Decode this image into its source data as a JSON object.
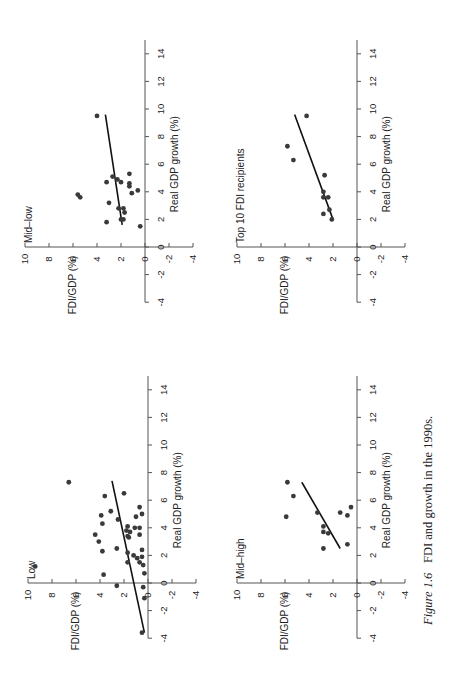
{
  "figure": {
    "caption_label": "Figure 1.6",
    "caption_text": "FDI and growth in the 1990s.",
    "orientation": "rotated 90° counter-clockwise"
  },
  "colors": {
    "axis": "#555555",
    "dot": "#3a3a3a",
    "line": "#111111",
    "text": "#222222"
  },
  "chart_data": [
    {
      "type": "scatter",
      "title": "Mid-low",
      "xlabel": "Real GDP growth (%)",
      "ylabel": "FDI/GDP (%)",
      "xlim": [
        -4,
        15
      ],
      "ylim": [
        -4,
        10
      ],
      "xticks": [
        -4,
        -2,
        0,
        2,
        4,
        6,
        8,
        10,
        12,
        14
      ],
      "yticks": [
        -4,
        -2,
        0,
        2,
        4,
        6,
        8,
        10
      ],
      "points": [
        [
          4.7,
          3.2
        ],
        [
          5.1,
          2.7
        ],
        [
          4.9,
          2.3
        ],
        [
          4.7,
          2.0
        ],
        [
          5.3,
          1.3
        ],
        [
          4.6,
          1.3
        ],
        [
          4.4,
          1.3
        ],
        [
          3.9,
          1.1
        ],
        [
          4.1,
          0.6
        ],
        [
          3.2,
          3.0
        ],
        [
          2.8,
          2.2
        ],
        [
          2.8,
          1.8
        ],
        [
          2.5,
          1.7
        ],
        [
          2.0,
          1.8
        ],
        [
          2.0,
          2.0
        ],
        [
          1.8,
          3.2
        ],
        [
          1.5,
          0.4
        ],
        [
          9.5,
          4.0
        ],
        [
          3.8,
          5.6
        ],
        [
          3.6,
          5.4
        ]
      ],
      "trendline": [
        [
          1.6,
          1.9
        ],
        [
          9.6,
          3.3
        ]
      ],
      "grid": false
    },
    {
      "type": "scatter",
      "title": "Top 10 FDI recipients",
      "xlabel": "Real GDP growth (%)",
      "ylabel": "FDI/GDP (%)",
      "xlim": [
        -4,
        15
      ],
      "ylim": [
        -4,
        10
      ],
      "xticks": [
        -4,
        -2,
        0,
        2,
        4,
        6,
        8,
        10,
        12,
        14
      ],
      "yticks": [
        -4,
        -2,
        0,
        2,
        4,
        6,
        8,
        10
      ],
      "points": [
        [
          2.0,
          2.1
        ],
        [
          2.7,
          2.3
        ],
        [
          2.4,
          2.8
        ],
        [
          3.6,
          2.4
        ],
        [
          3.6,
          2.8
        ],
        [
          4.0,
          2.8
        ],
        [
          5.2,
          2.7
        ],
        [
          6.3,
          5.3
        ],
        [
          7.3,
          5.8
        ],
        [
          9.5,
          4.2
        ]
      ],
      "trendline": [
        [
          2.0,
          2.0
        ],
        [
          9.6,
          5.2
        ]
      ],
      "grid": false
    },
    {
      "type": "scatter",
      "title": "Low",
      "xlabel": "Real GDP growth (%)",
      "ylabel": "FDI/GDP (%)",
      "xlim": [
        -4,
        15
      ],
      "ylim": [
        -4,
        10
      ],
      "xticks": [
        -4,
        -2,
        0,
        2,
        4,
        6,
        8,
        10,
        12,
        14
      ],
      "yticks": [
        -4,
        -2,
        0,
        2,
        4,
        6,
        8,
        10
      ],
      "points": [
        [
          7.3,
          6.6
        ],
        [
          6.3,
          3.6
        ],
        [
          6.5,
          2.0
        ],
        [
          5.2,
          3.1
        ],
        [
          4.9,
          3.9
        ],
        [
          4.3,
          3.8
        ],
        [
          4.6,
          2.5
        ],
        [
          5.5,
          0.7
        ],
        [
          5.0,
          0.5
        ],
        [
          4.8,
          1.0
        ],
        [
          3.5,
          4.4
        ],
        [
          3.0,
          4.1
        ],
        [
          2.3,
          3.8
        ],
        [
          2.5,
          2.6
        ],
        [
          4.1,
          1.7
        ],
        [
          3.8,
          1.8
        ],
        [
          3.7,
          1.5
        ],
        [
          3.4,
          1.7
        ],
        [
          3.3,
          1.6
        ],
        [
          4.0,
          1.1
        ],
        [
          4.0,
          0.7
        ],
        [
          3.5,
          0.7
        ],
        [
          2.2,
          1.7
        ],
        [
          2.4,
          0.5
        ],
        [
          2.0,
          1.2
        ],
        [
          1.8,
          0.9
        ],
        [
          1.9,
          0.5
        ],
        [
          1.5,
          1.7
        ],
        [
          1.5,
          0.7
        ],
        [
          1.3,
          0.4
        ],
        [
          0.7,
          0.3
        ],
        [
          0.6,
          3.7
        ],
        [
          -0.2,
          2.6
        ],
        [
          1.2,
          9.4
        ],
        [
          -0.3,
          0.4
        ],
        [
          -1.1,
          0.3
        ],
        [
          -3.6,
          0.5
        ]
      ],
      "trendline": [
        [
          -3.6,
          0.3
        ],
        [
          7.4,
          3.0
        ]
      ],
      "grid": false
    },
    {
      "type": "scatter",
      "title": "Mid–high",
      "xlabel": "Real GDP growth (%)",
      "ylabel": "FDI/GDP (%)",
      "xlim": [
        -4,
        15
      ],
      "ylim": [
        -4,
        10
      ],
      "xticks": [
        -4,
        -2,
        0,
        2,
        4,
        6,
        8,
        10,
        12,
        14
      ],
      "yticks": [
        -4,
        -2,
        0,
        2,
        4,
        6,
        8,
        10
      ],
      "points": [
        [
          7.3,
          5.8
        ],
        [
          6.3,
          5.3
        ],
        [
          4.8,
          5.9
        ],
        [
          5.1,
          3.3
        ],
        [
          5.1,
          1.4
        ],
        [
          4.9,
          0.8
        ],
        [
          5.5,
          0.5
        ],
        [
          4.1,
          2.8
        ],
        [
          3.7,
          2.8
        ],
        [
          3.6,
          2.4
        ],
        [
          2.5,
          2.8
        ],
        [
          2.8,
          0.8
        ]
      ],
      "trendline": [
        [
          2.5,
          1.4
        ],
        [
          7.3,
          4.6
        ]
      ],
      "grid": false
    }
  ],
  "panels": [
    {
      "title": "Mid–low",
      "xlabel": "Real GDP growth (%)",
      "ylabel": "FDI/GDP (%)"
    },
    {
      "title": "Top 10 FDI recipients",
      "xlabel": "Real GDP growth (%)",
      "ylabel": "FDI/GDP (%)"
    },
    {
      "title": "Low",
      "xlabel": "Real GDP growth (%)",
      "ylabel": "FDI/GDP (%)"
    },
    {
      "title": "Mid–high",
      "xlabel": "Real GDP growth (%)",
      "ylabel": "FDI/GDP (%)"
    }
  ]
}
